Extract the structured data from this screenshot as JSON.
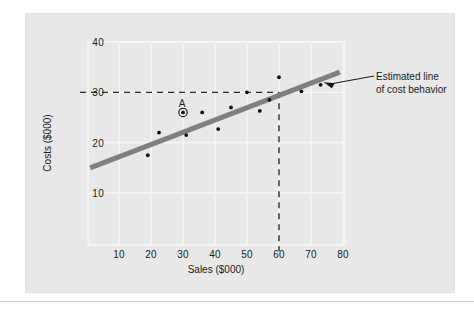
{
  "figure": {
    "background_color": "#e9e9e9",
    "page_color": "#ffffff"
  },
  "chart_data": {
    "type": "scatter",
    "title": "",
    "xlabel": "Sales ($000)",
    "ylabel": "Costs ($000)",
    "xlim": [
      0,
      84
    ],
    "ylim": [
      5,
      42
    ],
    "xticks": [
      10,
      20,
      30,
      40,
      50,
      60,
      70,
      80
    ],
    "yticks": [
      10,
      20,
      30,
      40
    ],
    "xtick_labels": [
      "10",
      "20",
      "30",
      "40",
      "50",
      "60",
      "70",
      "80"
    ],
    "ytick_labels": [
      "10",
      "20",
      "30",
      "40"
    ],
    "grid": true,
    "grid_color": "#f5f5f5",
    "legend": "none",
    "points": [
      {
        "x": 19.0,
        "y": 17.5
      },
      {
        "x": 22.5,
        "y": 22.0
      },
      {
        "x": 30.0,
        "y": 26.0,
        "label": "A",
        "highlight": true
      },
      {
        "x": 31.0,
        "y": 21.5
      },
      {
        "x": 36.0,
        "y": 26.0
      },
      {
        "x": 41.0,
        "y": 22.7
      },
      {
        "x": 45.0,
        "y": 27.0
      },
      {
        "x": 50.0,
        "y": 30.0
      },
      {
        "x": 54.0,
        "y": 26.3
      },
      {
        "x": 57.0,
        "y": 28.5
      },
      {
        "x": 60.0,
        "y": 33.0
      },
      {
        "x": 67.0,
        "y": 30.2
      },
      {
        "x": 73.0,
        "y": 31.5
      }
    ],
    "point_color": "#111111",
    "trend_line": {
      "name": "Estimated line of cost behavior",
      "color": "#808080",
      "x_start": 1.0,
      "y_start": 15.0,
      "x_end": 79.0,
      "y_end": 34.0,
      "width_px": 5
    },
    "reference_lines": [
      {
        "orientation": "horizontal",
        "value": 30,
        "style": "dashed",
        "color": "#222222",
        "from_x": 0,
        "to_x": 60
      },
      {
        "orientation": "vertical",
        "value": 60,
        "style": "dashed",
        "color": "#222222",
        "from_y": 5,
        "to_y": 30
      }
    ],
    "annotations": [
      {
        "name": "estimated-line-callout",
        "line1": "Estimated line",
        "line2": "of cost behavior",
        "arrow_from_x": 74.0,
        "arrow_from_y": 32.0
      }
    ],
    "highlight_marker": {
      "label": "A",
      "x": 30.0,
      "y": 26.0,
      "style": "circled-dot"
    }
  },
  "axes": {
    "x_title": "Sales ($000)",
    "y_title": "Costs ($000)",
    "x_tick_labels": [
      "10",
      "20",
      "30",
      "40",
      "50",
      "60",
      "70",
      "80"
    ],
    "y_tick_labels": [
      "40",
      "30",
      "20",
      "10"
    ]
  }
}
